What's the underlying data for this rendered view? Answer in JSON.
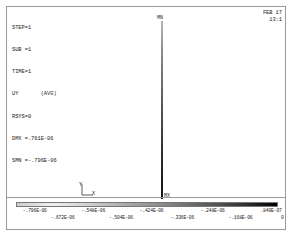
{
  "window": {
    "app": "ANSYS",
    "plot_type": "nodal-solution-contour"
  },
  "header": {
    "lines": [
      "STEP=1",
      "SUB =1",
      "TIME=1",
      "UY       (AVG)",
      "RSYS=0",
      "DMX =.761E-06",
      "SMN =-.796E-06"
    ]
  },
  "stamp": {
    "date": "FEB 17",
    "time": "13:1"
  },
  "model": {
    "min_marker": "MN",
    "max_marker": "MX"
  },
  "triad": {
    "y_label": "Y",
    "x_label": "X"
  },
  "legend": {
    "ticks_upper": [
      "-.796E-06",
      "-.548E-06",
      "-.424E-06",
      "-.248E-06",
      ".840E-07"
    ],
    "ticks_lower": [
      "-.672E-06",
      "-.504E-06",
      "-.336E-06",
      "-.168E-06",
      "0"
    ],
    "upper_positions": [
      10,
      31,
      52,
      74,
      95
    ],
    "lower_positions": [
      20,
      41,
      63,
      84,
      99
    ],
    "color_low": "#f0f0f0",
    "color_high": "#000000"
  },
  "chart_data": {
    "type": "heatmap",
    "xlabel": "",
    "ylabel": "",
    "legend_label": "UY (AVG)",
    "value_min": -7.96e-07,
    "value_max": 8.4e-08,
    "units": "m",
    "categories": [
      "-.796E-06",
      "-.672E-06",
      "-.548E-06",
      "-.504E-06",
      "-.424E-06",
      "-.336E-06",
      "-.248E-06",
      "-.168E-06",
      ".840E-07",
      "0"
    ],
    "values": [
      -7.96e-07,
      -6.72e-07,
      -5.48e-07,
      -5.04e-07,
      -4.24e-07,
      -3.36e-07,
      -2.48e-07,
      -1.68e-07,
      8.4e-08,
      0
    ],
    "grid": false,
    "legend_position": "bottom"
  }
}
